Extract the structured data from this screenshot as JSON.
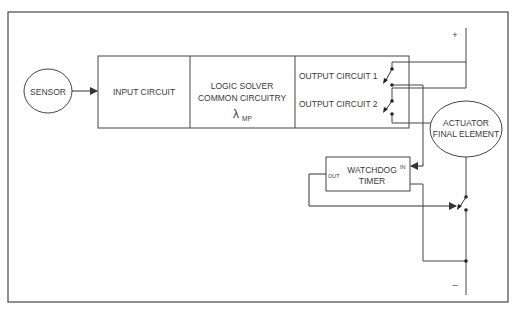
{
  "diagram": {
    "type": "logic-solver-watchdog-schematic",
    "nodes": {
      "sensor": {
        "label": "SENSOR"
      },
      "input_circuit": {
        "label": "INPUT CIRCUIT"
      },
      "logic_solver": {
        "line1": "LOGIC SOLVER",
        "line2": "COMMON CIRCUITRY",
        "symbol": "λ",
        "subscript": "MP"
      },
      "output_circuit_1": {
        "label": "OUTPUT CIRCUIT 1"
      },
      "output_circuit_2": {
        "label": "OUTPUT CIRCUIT 2"
      },
      "actuator": {
        "line1": "ACTUATOR",
        "line2": "FINAL ELEMENT"
      },
      "watchdog": {
        "line1": "WATCHDOG",
        "line2": "TIMER",
        "in_port": "IN",
        "out_port": "OUT"
      }
    },
    "rails": {
      "positive": "+",
      "negative": "–"
    },
    "edges": [
      {
        "from": "sensor",
        "to": "input_circuit",
        "arrow": true
      },
      {
        "from": "positive_rail",
        "to": "output_circuit_1_switch"
      },
      {
        "from": "positive_rail",
        "to": "output_circuit_2_switch"
      },
      {
        "from": "output_circuit_1_switch",
        "to": "watchdog.in",
        "arrow": true
      },
      {
        "from": "output_circuit_2_switch",
        "to": "actuator"
      },
      {
        "from": "actuator",
        "to": "watchdog_switch"
      },
      {
        "from": "watchdog.out",
        "to": "watchdog_switch",
        "arrow": true
      },
      {
        "from": "watchdog",
        "to": "negative_rail"
      },
      {
        "from": "watchdog_switch",
        "to": "negative_rail"
      }
    ],
    "colors": {
      "line": "#4a4a4a",
      "text": "#3a3a3a",
      "background": "#ffffff"
    }
  }
}
